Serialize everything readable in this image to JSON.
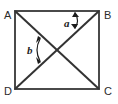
{
  "figure": {
    "shape": "square",
    "background_color": "#ffffff",
    "edge_color": "#4a4a4a",
    "diagonal_color": "#333333",
    "label_color": "#1c1c1c",
    "vertices": [
      {
        "id": "A",
        "label": "A",
        "position": "top-left",
        "x": 15,
        "y": 11,
        "label_x": 4,
        "label_y": 11
      },
      {
        "id": "B",
        "label": "B",
        "position": "top-right",
        "x": 99,
        "y": 11,
        "label_x": 104,
        "label_y": 11
      },
      {
        "id": "C",
        "label": "C",
        "position": "bottom-right",
        "x": 99,
        "y": 89,
        "label_x": 104,
        "label_y": 95
      },
      {
        "id": "D",
        "label": "D",
        "position": "bottom-left",
        "x": 15,
        "y": 89,
        "label_x": 4,
        "label_y": 95
      }
    ],
    "diagonals": [
      {
        "id": "AC",
        "from": "A",
        "to": "C"
      },
      {
        "id": "BD",
        "from": "B",
        "to": "D"
      }
    ],
    "center": {
      "x": 57,
      "y": 50
    },
    "angles": [
      {
        "id": "a",
        "label": "a",
        "description": "angle between side AB and diagonal BD at vertex B",
        "label_x": 64,
        "label_y": 27,
        "arc_style": "double-headed-arrow"
      },
      {
        "id": "b",
        "label": "b",
        "description": "angle between diagonal AC and diagonal BD at the center",
        "label_x": 27,
        "label_y": 54,
        "arc_style": "double-headed-arrow"
      }
    ]
  }
}
